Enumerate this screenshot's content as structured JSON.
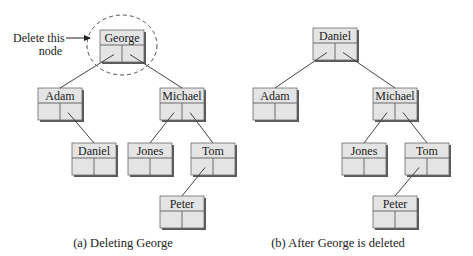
{
  "colors": {
    "node_fill": "#e4e4e4",
    "node_stroke": "#6a6a6a",
    "node_shadow": "#5a5a5a",
    "edge": "#444444",
    "text": "#222222",
    "dashed_circle": "#555555"
  },
  "node_size": {
    "w": 44,
    "h": 32,
    "label_h": 15
  },
  "panel_a": {
    "caption": "(a) Deleting George",
    "caption_x": 123,
    "caption_y": 247,
    "annotation": {
      "line1": "Delete this",
      "line2": "node",
      "line1_x": 13,
      "line1_y": 42,
      "line2_x": 62,
      "line2_y": 55,
      "arrow": {
        "x1": 66,
        "y1": 38,
        "x2": 90,
        "y2": 38
      }
    },
    "highlight_circle": {
      "cx": 122,
      "cy": 45,
      "rx": 35,
      "ry": 30
    },
    "nodes": [
      {
        "id": "a-george",
        "label": "George",
        "x": 100,
        "y": 30
      },
      {
        "id": "a-adam",
        "label": "Adam",
        "x": 38,
        "y": 88
      },
      {
        "id": "a-michael",
        "label": "Michael",
        "x": 160,
        "y": 88
      },
      {
        "id": "a-daniel",
        "label": "Daniel",
        "x": 72,
        "y": 143
      },
      {
        "id": "a-jones",
        "label": "Jones",
        "x": 128,
        "y": 143
      },
      {
        "id": "a-tom",
        "label": "Tom",
        "x": 191,
        "y": 143
      },
      {
        "id": "a-peter",
        "label": "Peter",
        "x": 160,
        "y": 196
      }
    ],
    "edges": [
      {
        "from": "a-george",
        "side": "left",
        "to": "a-adam"
      },
      {
        "from": "a-george",
        "side": "right",
        "to": "a-michael"
      },
      {
        "from": "a-adam",
        "side": "right",
        "to": "a-daniel"
      },
      {
        "from": "a-michael",
        "side": "left",
        "to": "a-jones"
      },
      {
        "from": "a-michael",
        "side": "right",
        "to": "a-tom"
      },
      {
        "from": "a-tom",
        "side": "left",
        "to": "a-peter"
      }
    ]
  },
  "panel_b": {
    "caption": "(b) After George is deleted",
    "caption_x": 338,
    "caption_y": 247,
    "nodes": [
      {
        "id": "b-daniel",
        "label": "Daniel",
        "x": 313,
        "y": 28
      },
      {
        "id": "b-adam",
        "label": "Adam",
        "x": 253,
        "y": 88
      },
      {
        "id": "b-michael",
        "label": "Michael",
        "x": 373,
        "y": 88
      },
      {
        "id": "b-jones",
        "label": "Jones",
        "x": 342,
        "y": 143
      },
      {
        "id": "b-tom",
        "label": "Tom",
        "x": 405,
        "y": 143
      },
      {
        "id": "b-peter",
        "label": "Peter",
        "x": 373,
        "y": 196
      }
    ],
    "edges": [
      {
        "from": "b-daniel",
        "side": "left",
        "to": "b-adam"
      },
      {
        "from": "b-daniel",
        "side": "right",
        "to": "b-michael"
      },
      {
        "from": "b-michael",
        "side": "left",
        "to": "b-jones"
      },
      {
        "from": "b-michael",
        "side": "right",
        "to": "b-tom"
      },
      {
        "from": "b-tom",
        "side": "left",
        "to": "b-peter"
      }
    ]
  }
}
